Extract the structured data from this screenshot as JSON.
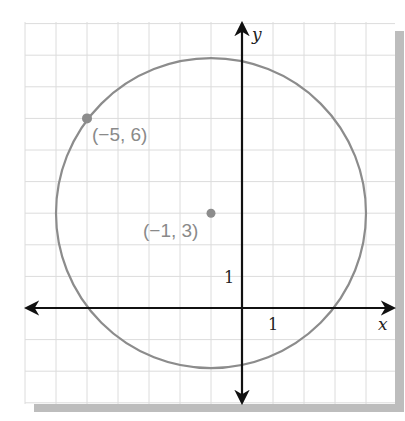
{
  "chart_data": {
    "type": "scatter",
    "title": "",
    "xlabel": "x",
    "ylabel": "y",
    "xlim": [
      -7,
      5
    ],
    "ylim": [
      -3,
      9
    ],
    "grid": true,
    "unit_tick_labels": {
      "x": "1",
      "y": "1"
    },
    "circle": {
      "center": [
        -1,
        3
      ],
      "radius": 5
    },
    "points": [
      {
        "x": -5,
        "y": 6,
        "label": "(−5, 6)"
      },
      {
        "x": -1,
        "y": 3,
        "label": "(−1, 3)"
      }
    ]
  },
  "colors": {
    "grid": "#dcdcdc",
    "axis": "#111111",
    "circle": "#8c8c8c",
    "point": "#8c8c8c",
    "shadow": "#bdbdbd"
  }
}
